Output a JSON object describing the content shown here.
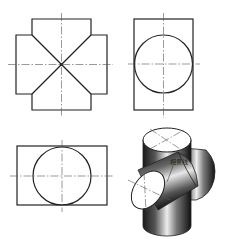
{
  "diagram": {
    "colors": {
      "line": "#222222",
      "centerline": "#555555",
      "background": "#ffffff",
      "shade_dark": "#111111",
      "shade_light": "#f2f2f2"
    },
    "views": [
      {
        "name": "front-view",
        "description": "Cross-shaped outline with diagonal intersection lines meeting at center"
      },
      {
        "name": "side-view",
        "description": "Rectangle with inscribed circle and centerlines"
      },
      {
        "name": "top-view",
        "description": "Horizontal rectangle with inscribed circle and centerlines"
      },
      {
        "name": "isometric-view",
        "description": "Shaded 3D model of vertical and horizontal cylinders intersecting"
      }
    ],
    "annotation": {
      "text": "相贯线",
      "target": "intersection-curve"
    }
  }
}
